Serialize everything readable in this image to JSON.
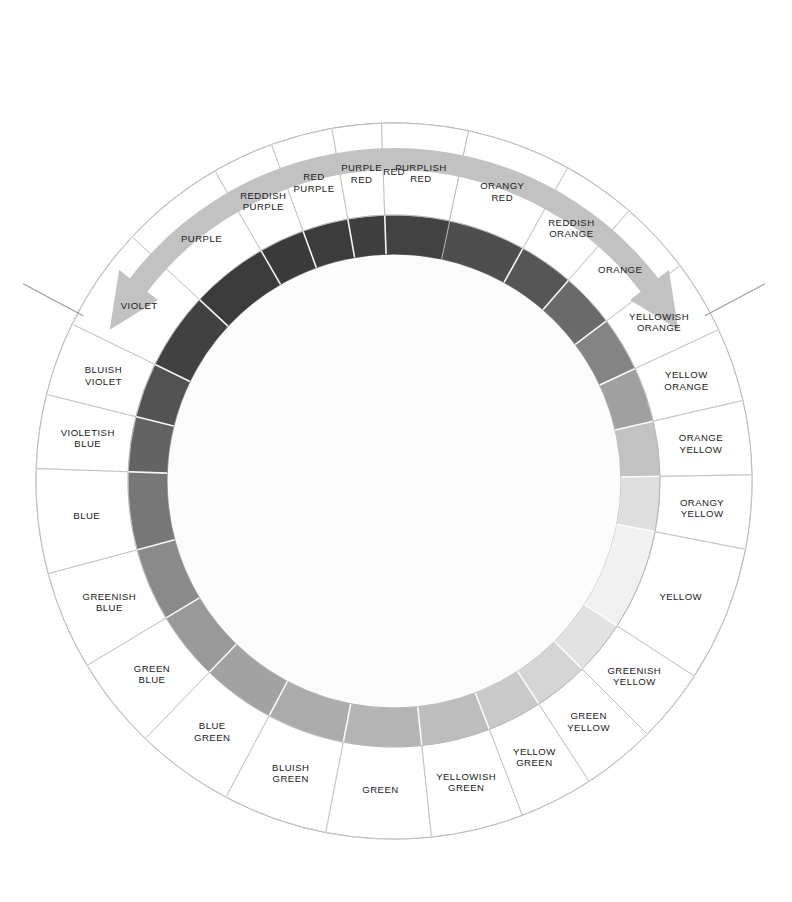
{
  "figure": {
    "kind": "color-wheel-diagram",
    "background": "#ffffff",
    "center": {
      "x": 394,
      "y": 481
    },
    "radii": {
      "inner_white": 226,
      "band_inner": 227,
      "band_outer": 266,
      "label_outer": 358
    },
    "stroke": "#b9b9b9",
    "label_color": "#1a1a1a"
  },
  "arrow": {
    "name": "bidirectional-rotation-arrow",
    "color": "#c2c2c2",
    "description": "curved double-headed arrow spanning the top of the wheel",
    "span_degrees": [
      -62,
      62
    ],
    "radius": 322,
    "thickness": 22,
    "head_size": 34
  },
  "guide_lines": [
    {
      "name": "left-guide-line",
      "angle_deg": -62,
      "from_r": 352,
      "to_r": 420
    },
    {
      "name": "right-guide-line",
      "angle_deg": 62,
      "from_r": 352,
      "to_r": 420
    }
  ],
  "chart_data": {
    "type": "pie",
    "legend": "none",
    "grid": false,
    "note": "30 hue segments rendered in grayscale; each segment spans a sweep in degrees measured clockwise from 12 o'clock (top).",
    "categories": [
      "RED",
      "ORANGY\nRED",
      "REDDISH\nORANGE",
      "ORANGE",
      "YELLOWISH\nORANGE",
      "YELLOW\nORANGE",
      "ORANGE\nYELLOW",
      "ORANGY\nYELLOW",
      "YELLOW",
      "GREENISH\nYELLOW",
      "GREEN\nYELLOW",
      "YELLOW\nGREEN",
      "YELLOWISH\nGREEN",
      "GREEN",
      "BLUISH\nGREEN",
      "BLUE\nGREEN",
      "GREEN\nBLUE",
      "GREENISH\nBLUE",
      "BLUE",
      "VIOLETISH\nBLUE",
      "BLUISH\nVIOLET",
      "VIOLET",
      "PURPLE",
      "REDDISH\nPURPLE",
      "RED\nPURPLE",
      "PURPLE\nRED",
      "PURPLISH\nRED"
    ],
    "segments": [
      {
        "label": "RED",
        "start_deg": -12.0,
        "sweep_deg": 24.0,
        "gray": "#4a4a4a"
      },
      {
        "label": "ORANGY\nRED",
        "start_deg": 12.0,
        "sweep_deg": 17.0,
        "gray": "#4e4e4e"
      },
      {
        "label": "REDDISH\nORANGE",
        "start_deg": 29.0,
        "sweep_deg": 12.0,
        "gray": "#565656"
      },
      {
        "label": "ORANGE",
        "start_deg": 41.0,
        "sweep_deg": 12.0,
        "gray": "#6a6a6a"
      },
      {
        "label": "YELLOWISH\nORANGE",
        "start_deg": 53.0,
        "sweep_deg": 12.0,
        "gray": "#848484"
      },
      {
        "label": "YELLOW\nORANGE",
        "start_deg": 65.0,
        "sweep_deg": 12.0,
        "gray": "#a0a0a0"
      },
      {
        "label": "ORANGE\nYELLOW",
        "start_deg": 77.0,
        "sweep_deg": 12.0,
        "gray": "#c2c2c2"
      },
      {
        "label": "ORANGY\nYELLOW",
        "start_deg": 89.0,
        "sweep_deg": 12.0,
        "gray": "#dedede"
      },
      {
        "label": "YELLOW",
        "start_deg": 101.0,
        "sweep_deg": 22.0,
        "gray": "#f1f1f1"
      },
      {
        "label": "GREENISH\nYELLOW",
        "start_deg": 123.0,
        "sweep_deg": 12.0,
        "gray": "#e2e2e2"
      },
      {
        "label": "GREEN\nYELLOW",
        "start_deg": 135.0,
        "sweep_deg": 12.0,
        "gray": "#d5d5d5"
      },
      {
        "label": "YELLOW\nGREEN",
        "start_deg": 147.0,
        "sweep_deg": 12.0,
        "gray": "#c9c9c9"
      },
      {
        "label": "YELLOWISH\nGREEN",
        "start_deg": 159.0,
        "sweep_deg": 15.0,
        "gray": "#bdbdbd"
      },
      {
        "label": "GREEN",
        "start_deg": 174.0,
        "sweep_deg": 17.0,
        "gray": "#b4b4b4"
      },
      {
        "label": "BLUISH\nGREEN",
        "start_deg": 191.0,
        "sweep_deg": 17.0,
        "gray": "#ababab"
      },
      {
        "label": "BLUE\nGREEN",
        "start_deg": 208.0,
        "sweep_deg": 16.0,
        "gray": "#a2a2a2"
      },
      {
        "label": "GREEN\nBLUE",
        "start_deg": 224.0,
        "sweep_deg": 15.0,
        "gray": "#999999"
      },
      {
        "label": "GREENISH\nBLUE",
        "start_deg": 239.0,
        "sweep_deg": 16.0,
        "gray": "#8a8a8a"
      },
      {
        "label": "BLUE",
        "start_deg": 255.0,
        "sweep_deg": 17.0,
        "gray": "#777777"
      },
      {
        "label": "VIOLETISH\nBLUE",
        "start_deg": 272.0,
        "sweep_deg": 12.0,
        "gray": "#636363"
      },
      {
        "label": "BLUISH\nVIOLET",
        "start_deg": 284.0,
        "sweep_deg": 12.0,
        "gray": "#525252"
      },
      {
        "label": "VIOLET",
        "start_deg": 296.0,
        "sweep_deg": 17.0,
        "gray": "#414141"
      },
      {
        "label": "PURPLE",
        "start_deg": 313.0,
        "sweep_deg": 17.0,
        "gray": "#3b3b3b"
      },
      {
        "label": "REDDISH\nPURPLE",
        "start_deg": 330.0,
        "sweep_deg": 10.0,
        "gray": "#3a3a3a"
      },
      {
        "label": "RED\nPURPLE",
        "start_deg": 340.0,
        "sweep_deg": 10.0,
        "gray": "#3c3c3c"
      },
      {
        "label": "PURPLE\nRED",
        "start_deg": 350.0,
        "sweep_deg": 8.0,
        "gray": "#3e3e3e"
      },
      {
        "label": "PURPLISH\nRED",
        "start_deg": 358.0,
        "sweep_deg": 14.0,
        "gray": "#424242"
      }
    ]
  }
}
